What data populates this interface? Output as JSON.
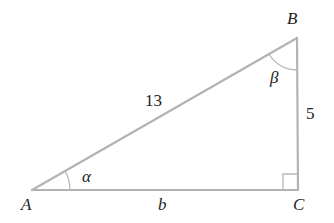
{
  "diagram": {
    "type": "right-triangle",
    "vertices": {
      "A": {
        "label": "A"
      },
      "B": {
        "label": "B"
      },
      "C": {
        "label": "C"
      }
    },
    "sides": {
      "hypotenuse_AB": {
        "label": "13"
      },
      "leg_BC": {
        "label": "5"
      },
      "leg_AC": {
        "label": "b"
      }
    },
    "angles": {
      "at_A": {
        "label": "α"
      },
      "at_B": {
        "label": "β"
      },
      "at_C": {
        "label": "right-angle"
      }
    },
    "colors": {
      "lines": "#b3b3b3",
      "text": "#222222"
    }
  }
}
